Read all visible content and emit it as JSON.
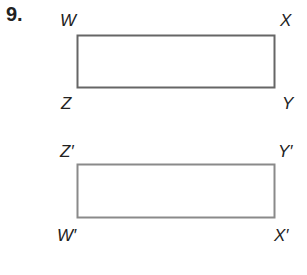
{
  "problem": {
    "number": "9.",
    "original": {
      "vertices": {
        "top_left": "W",
        "top_right": "X",
        "bottom_right": "Y",
        "bottom_left": "Z"
      },
      "stroke": "#666666"
    },
    "image": {
      "vertices": {
        "top_left": "Z′",
        "top_right": "Y′",
        "bottom_right": "X′",
        "bottom_left": "W′"
      },
      "stroke": "#888888"
    }
  }
}
